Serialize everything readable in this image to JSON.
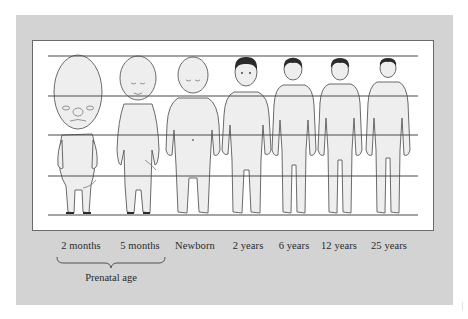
{
  "figure": {
    "labels": [
      {
        "text": "2 months",
        "x": 81
      },
      {
        "text": "5 months",
        "x": 140
      },
      {
        "text": "Newborn",
        "x": 195
      },
      {
        "text": "2 years",
        "x": 248
      },
      {
        "text": "6 years",
        "x": 294
      },
      {
        "text": "12 years",
        "x": 339
      },
      {
        "text": "25 years",
        "x": 389
      }
    ],
    "group": {
      "text": "Prenatal age",
      "spans": [
        "2 months",
        "5 months"
      ]
    },
    "guide_lines": 5,
    "colors": {
      "panel": "#d3d3d3",
      "box": "#ffffff",
      "skin": "#efefef",
      "outline": "#555555",
      "hair": "#2b2b2b",
      "line": "#4a4a4a"
    }
  }
}
